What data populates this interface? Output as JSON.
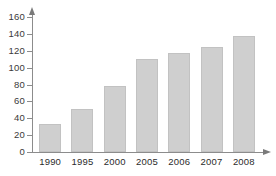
{
  "chart_data": {
    "type": "bar",
    "title": "",
    "xlabel": "",
    "ylabel": "",
    "categories": [
      "1990",
      "1995",
      "2000",
      "2005",
      "2006",
      "2007",
      "2008"
    ],
    "values": [
      33,
      51,
      78,
      110,
      117,
      125,
      137
    ],
    "ylim": [
      0,
      160
    ],
    "yticks": [
      0,
      20,
      40,
      60,
      80,
      100,
      120,
      140,
      160
    ],
    "ytick_labels": [
      "0",
      "20",
      "40",
      "60",
      "80",
      "100",
      "120",
      "140",
      "160"
    ],
    "grid": false,
    "legend": null,
    "series": [
      {
        "name": "",
        "values": [
          33,
          51,
          78,
          110,
          117,
          125,
          137
        ]
      }
    ],
    "bar_color": "#cfcfcf",
    "axis_color": "#8c8c8c",
    "text_color": "#2b2b2b"
  }
}
